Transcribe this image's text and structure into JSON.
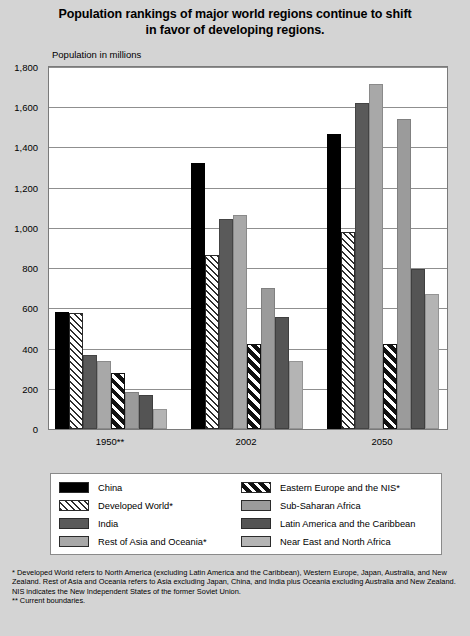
{
  "title": {
    "line1": "Population rankings of major world regions continue to shift",
    "line2": "in favor of developing regions."
  },
  "axis_caption": "Population in millions",
  "footnotes": {
    "star": "* Developed World refers to North America (excluding Latin America and the Caribbean), Western Europe, Japan, Australia, and New Zealand.  Rest of Asia and Oceania refers to Asia excluding Japan, China, and India plus Oceania excluding Australia and New Zealand.  NIS indicates the New Independent States of the former Soviet Union.",
    "doublestar": "** Current boundaries."
  },
  "legend": {
    "left": [
      {
        "label": "China",
        "key": "china"
      },
      {
        "label": "Developed World*",
        "key": "developed"
      },
      {
        "label": "India",
        "key": "india"
      },
      {
        "label": "Rest of Asia and Oceania*",
        "key": "restasia"
      }
    ],
    "right": [
      {
        "label": "Eastern Europe and the NIS*",
        "key": "eeurope"
      },
      {
        "label": "Sub-Saharan Africa",
        "key": "subsaharan"
      },
      {
        "label": "Latin America and the Caribbean",
        "key": "latam"
      },
      {
        "label": "Near East and North Africa",
        "key": "neareast"
      }
    ]
  },
  "chart_data": {
    "type": "bar",
    "title": "Population rankings of major world regions continue to shift in favor of developing regions.",
    "xlabel": "",
    "ylabel": "Population in millions",
    "ylim": [
      0,
      1800
    ],
    "yticks": [
      0,
      200,
      400,
      600,
      800,
      1000,
      1200,
      1400,
      1600,
      1800
    ],
    "ytick_labels": [
      "0",
      "200",
      "400",
      "600",
      "800",
      "1,000",
      "1,200",
      "1,400",
      "1,600",
      "1,800"
    ],
    "grid": true,
    "legend_position": "below-plot",
    "categories": [
      "1950**",
      "2002",
      "2050"
    ],
    "series": [
      {
        "name": "China",
        "key": "china",
        "values": [
          580,
          1325,
          1465
        ]
      },
      {
        "name": "Developed World*",
        "key": "developed",
        "values": [
          575,
          865,
          980
        ]
      },
      {
        "name": "India",
        "key": "india",
        "values": [
          370,
          1045,
          1620
        ]
      },
      {
        "name": "Rest of Asia and Oceania*",
        "key": "restasia",
        "values": [
          340,
          1065,
          1715
        ]
      },
      {
        "name": "Eastern Europe and the NIS*",
        "key": "eeurope",
        "values": [
          280,
          425,
          425
        ]
      },
      {
        "name": "Sub-Saharan Africa",
        "key": "subsaharan",
        "values": [
          185,
          700,
          1540
        ]
      },
      {
        "name": "Latin America and the Caribbean",
        "key": "latam",
        "values": [
          167,
          555,
          795
        ]
      },
      {
        "name": "Near East and North Africa",
        "key": "neareast",
        "values": [
          100,
          340,
          670
        ]
      }
    ]
  },
  "colors": {
    "background": "#d4d4d4",
    "plot_background": "#ffffff",
    "grid": "#8f8f8f",
    "china": "#000000",
    "india": "#5a5a5a",
    "restasia": "#a8a8a8",
    "subsaharan": "#9b9b9b",
    "latam": "#545454",
    "neareast": "#b4b4b4"
  }
}
